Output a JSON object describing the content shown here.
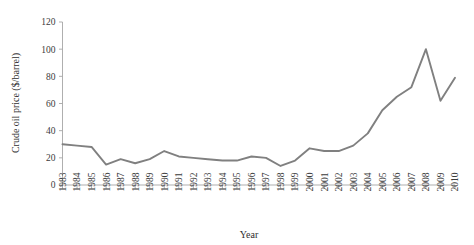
{
  "chart_data": {
    "type": "line",
    "title": "",
    "xlabel": "Year",
    "ylabel": "Crude oil price ($/barrel)",
    "xlim": [
      1983,
      2010
    ],
    "ylim": [
      0,
      120
    ],
    "yticks": [
      0,
      20,
      40,
      60,
      80,
      100,
      120
    ],
    "grid": false,
    "legend": "none",
    "line_color": "#808080",
    "axis_color": "#a6a6a6",
    "text_color": "#3b3b3b",
    "categories": [
      "1983",
      "1984",
      "1985",
      "1986",
      "1987",
      "1988",
      "1989",
      "1990",
      "1991",
      "1992",
      "1993",
      "1994",
      "1995",
      "1996",
      "1997",
      "1998",
      "1999",
      "2000",
      "2001",
      "2002",
      "2003",
      "2004",
      "2005",
      "2006",
      "2007",
      "2008",
      "2009",
      "2010"
    ],
    "series": [
      {
        "name": "Crude oil price",
        "values": [
          30,
          29,
          28,
          15,
          19,
          16,
          19,
          25,
          21,
          20,
          19,
          18,
          18,
          21,
          20,
          14,
          18,
          27,
          25,
          25,
          29,
          38,
          55,
          65,
          72,
          100,
          62,
          79
        ]
      }
    ]
  }
}
